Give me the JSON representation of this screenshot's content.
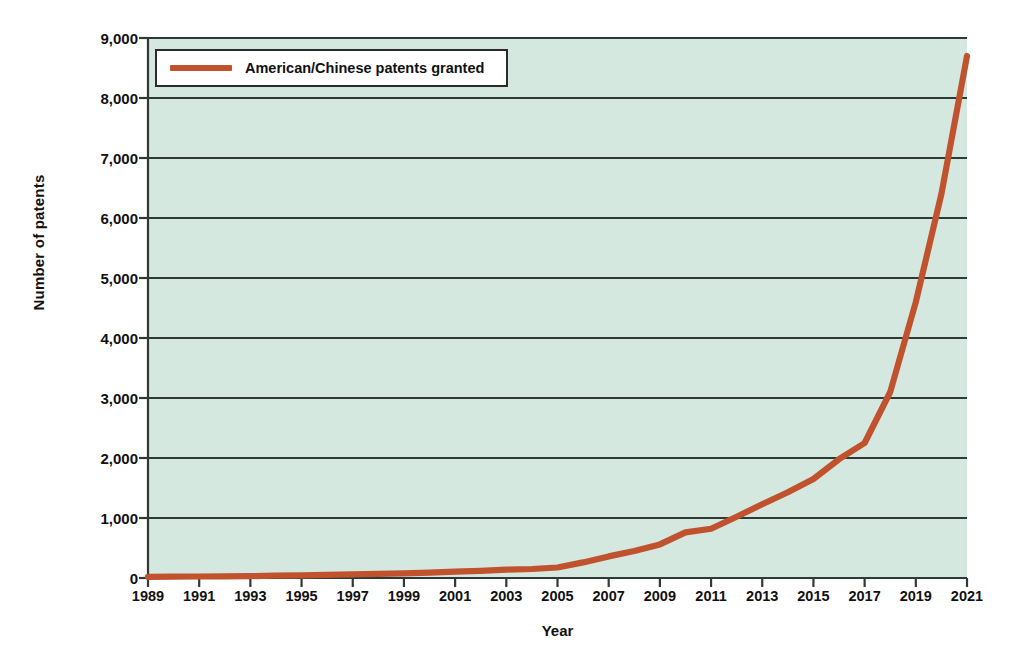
{
  "chart_data": {
    "type": "line",
    "title": "",
    "xlabel": "Year",
    "ylabel": "Number of patents",
    "xlim": [
      1989,
      2021
    ],
    "ylim": [
      0,
      9000
    ],
    "grid": true,
    "legend_position": "upper-left-inside",
    "background_color": "#d4e8e0",
    "line_color": "#c0522d",
    "gridline_color": "#2f3a37",
    "y_ticks": [
      0,
      1000,
      2000,
      3000,
      4000,
      5000,
      6000,
      7000,
      8000,
      9000
    ],
    "y_tick_labels": [
      "0",
      "1,000",
      "2,000",
      "3,000",
      "4,000",
      "5,000",
      "6,000",
      "7,000",
      "8,000",
      "9,000"
    ],
    "x_ticks": [
      1989,
      1991,
      1993,
      1995,
      1997,
      1999,
      2001,
      2003,
      2005,
      2007,
      2009,
      2011,
      2013,
      2015,
      2017,
      2019,
      2021
    ],
    "x_tick_labels": [
      "1989",
      "1991",
      "1993",
      "1995",
      "1997",
      "1999",
      "2001",
      "2003",
      "2005",
      "2007",
      "2009",
      "2011",
      "2013",
      "2015",
      "2017",
      "2019",
      "2021"
    ],
    "series": [
      {
        "name": "American/Chinese patents granted",
        "color": "#c0522d",
        "x": [
          1989,
          1990,
          1991,
          1992,
          1993,
          1994,
          1995,
          1996,
          1997,
          1998,
          1999,
          2000,
          2001,
          2002,
          2003,
          2004,
          2005,
          2006,
          2007,
          2008,
          2009,
          2010,
          2011,
          2012,
          2013,
          2014,
          2015,
          2016,
          2017,
          2018,
          2019,
          2020,
          2021
        ],
        "values": [
          20,
          22,
          25,
          28,
          32,
          38,
          45,
          52,
          60,
          68,
          78,
          90,
          105,
          120,
          140,
          150,
          175,
          260,
          360,
          450,
          560,
          760,
          820,
          1020,
          1230,
          1430,
          1650,
          1980,
          2250,
          3100,
          4600,
          6400,
          8700
        ]
      }
    ]
  },
  "legend": {
    "entries": [
      {
        "label": "American/Chinese patents granted",
        "color": "#c0522d"
      }
    ]
  }
}
